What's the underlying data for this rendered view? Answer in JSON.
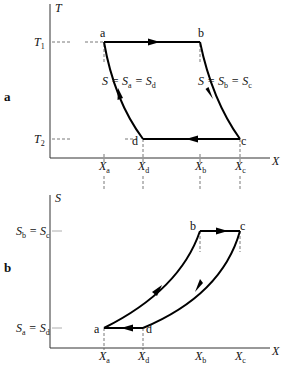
{
  "panels": [
    {
      "id": "a",
      "label": "a",
      "y_axis": {
        "label": "T",
        "ticks": [
          {
            "label": "T",
            "sub": "1"
          },
          {
            "label": "T",
            "sub": "2"
          }
        ]
      },
      "x_axis": {
        "label": "X",
        "ticks": [
          {
            "label": "X",
            "sub": "a"
          },
          {
            "label": "X",
            "sub": "d"
          },
          {
            "label": "X",
            "sub": "b"
          },
          {
            "label": "X",
            "sub": "c"
          }
        ]
      },
      "points": [
        {
          "name": "a"
        },
        {
          "name": "b"
        },
        {
          "name": "c"
        },
        {
          "name": "d"
        }
      ],
      "annotations": [
        {
          "text": "S = S",
          "sub1": "a",
          "eq": " = S",
          "sub2": "d"
        },
        {
          "text": "S = S",
          "sub1": "b",
          "eq": " = S",
          "sub2": "c"
        }
      ]
    },
    {
      "id": "b",
      "label": "b",
      "y_axis": {
        "label": "S",
        "ticks": [
          {
            "label": "S",
            "sub": "b",
            "eq": " = S",
            "sub2": "c"
          },
          {
            "label": "S",
            "sub": "a",
            "eq": " = S",
            "sub2": "d"
          }
        ]
      },
      "x_axis": {
        "label": "X",
        "ticks": [
          {
            "label": "X",
            "sub": "a"
          },
          {
            "label": "X",
            "sub": "d"
          },
          {
            "label": "X",
            "sub": "b"
          },
          {
            "label": "X",
            "sub": "c"
          }
        ]
      },
      "points": [
        {
          "name": "a"
        },
        {
          "name": "b"
        },
        {
          "name": "c"
        },
        {
          "name": "d"
        }
      ]
    }
  ]
}
